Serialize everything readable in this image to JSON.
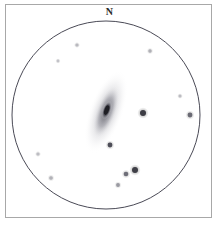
{
  "sketch": {
    "title": "Eyepiece field sketch",
    "orientation_label": "N",
    "frame": {
      "x": 5,
      "y": 4,
      "width": 207,
      "height": 214,
      "border_color": "#a8a8a8",
      "background_color": "#ffffff"
    },
    "field_of_view_circle": {
      "center_x": 106,
      "center_y": 115,
      "radius": 94,
      "stroke_color": "#4a4a56",
      "stroke_width": 1
    },
    "galaxy": {
      "name": "galaxy",
      "center_x": 106,
      "center_y": 112,
      "halo_rx": 17,
      "halo_ry": 44,
      "rotation_deg": 20,
      "halo_color": "#b8b8bd",
      "inner_rx": 10,
      "inner_ry": 28,
      "inner_color": "#8e8e96",
      "core_rx": 4.5,
      "core_ry": 10,
      "core_center_x": 106,
      "core_center_y": 110,
      "core_color": "#3a3a42",
      "nucleus_rx": 2.2,
      "nucleus_ry": 5,
      "nucleus_color": "#1e1e24"
    },
    "stars": [
      {
        "id": "star-1",
        "x": 77,
        "y": 45,
        "r": 1.6,
        "color": "#b9b9bf",
        "label": "faint-star-upper-left"
      },
      {
        "id": "star-2",
        "x": 58,
        "y": 61,
        "r": 1.4,
        "color": "#c2c2c8",
        "label": "faint-star-upper-left-outer"
      },
      {
        "id": "star-3",
        "x": 150,
        "y": 51,
        "r": 1.7,
        "color": "#b0b0b6",
        "label": "faint-star-upper-right"
      },
      {
        "id": "star-4",
        "x": 180,
        "y": 96,
        "r": 1.5,
        "color": "#bcbcc2",
        "label": "faint-star-right"
      },
      {
        "id": "star-5",
        "x": 143,
        "y": 113,
        "r": 3.0,
        "color": "#3c3c44",
        "label": "bright-star-east"
      },
      {
        "id": "star-6",
        "x": 190,
        "y": 115,
        "r": 2.4,
        "color": "#6a6a74",
        "label": "edge-star-east"
      },
      {
        "id": "star-7",
        "x": 110,
        "y": 145,
        "r": 2.4,
        "color": "#4e4e58",
        "label": "star-below-galaxy"
      },
      {
        "id": "star-8",
        "x": 38,
        "y": 154,
        "r": 1.6,
        "color": "#bdbdc3",
        "label": "faint-star-lower-left"
      },
      {
        "id": "star-9",
        "x": 51,
        "y": 178,
        "r": 1.8,
        "color": "#b2b2b8",
        "label": "faint-star-lower-left-outer"
      },
      {
        "id": "star-10",
        "x": 135,
        "y": 170,
        "r": 3.0,
        "color": "#3f3f47",
        "label": "bright-star-lower-right"
      },
      {
        "id": "star-11",
        "x": 126,
        "y": 174,
        "r": 2.3,
        "color": "#6e6e78",
        "label": "star-lower-right-companion"
      },
      {
        "id": "star-12",
        "x": 118,
        "y": 185,
        "r": 1.9,
        "color": "#9a9aa2",
        "label": "star-lower-right-faint"
      }
    ]
  }
}
